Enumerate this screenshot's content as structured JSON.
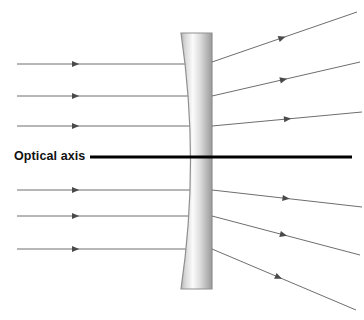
{
  "figure": {
    "labels": {
      "optical_axis": "Optical axis"
    },
    "colors": {
      "ray": "#6e6e6e",
      "axis": "#000000",
      "lens_outline": "#8a8a8a",
      "lens_light": "#fdfdfd",
      "lens_dark": "#9a9a9a",
      "background": "#ffffff"
    },
    "lens": {
      "type": "biconcave-diverging",
      "left_x": 181,
      "right_x": 212,
      "top_y": 33,
      "bottom_y": 289,
      "waist_x": 196,
      "waist_y": 161
    },
    "optical_axis": {
      "y": 157,
      "x_start": 90,
      "x_end": 352,
      "thickness": 3
    },
    "incoming_rays": [
      {
        "y": 64,
        "x_start": 17,
        "x_end": 196,
        "arrow_x": 72
      },
      {
        "y": 96,
        "x_start": 17,
        "x_end": 199,
        "arrow_x": 72
      },
      {
        "y": 126,
        "x_start": 17,
        "x_end": 203,
        "arrow_x": 72
      },
      {
        "y": 190,
        "x_start": 17,
        "x_end": 203,
        "arrow_x": 72
      },
      {
        "y": 216,
        "x_start": 17,
        "x_end": 199,
        "arrow_x": 72
      },
      {
        "y": 249,
        "x_start": 17,
        "x_end": 196,
        "arrow_x": 72
      }
    ],
    "outgoing_rays": [
      {
        "x_start": 212,
        "y_start": 62,
        "x_end": 357,
        "y_end": 12,
        "arrow_t": 0.46
      },
      {
        "x_start": 212,
        "y_start": 96,
        "x_end": 360,
        "y_end": 62,
        "arrow_t": 0.46
      },
      {
        "x_start": 212,
        "y_start": 126,
        "x_end": 362,
        "y_end": 112,
        "arrow_t": 0.48
      },
      {
        "x_start": 212,
        "y_start": 190,
        "x_end": 362,
        "y_end": 207,
        "arrow_t": 0.47
      },
      {
        "x_start": 212,
        "y_start": 216,
        "x_end": 360,
        "y_end": 255,
        "arrow_t": 0.46
      },
      {
        "x_start": 212,
        "y_start": 249,
        "x_end": 356,
        "y_end": 310,
        "arrow_t": 0.44
      }
    ]
  }
}
